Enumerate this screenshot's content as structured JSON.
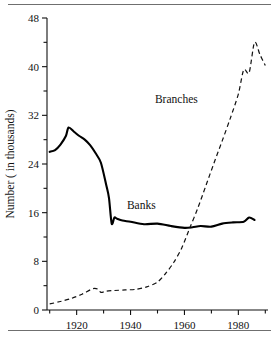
{
  "chart_data": {
    "type": "line",
    "title": "",
    "xlabel": "",
    "ylabel": "Number ( in thousands)",
    "xlim": [
      1909,
      1991
    ],
    "ylim": [
      0,
      48
    ],
    "grid": false,
    "legend_position": "inline-annotations",
    "y_ticks_major": [
      0,
      8,
      16,
      24,
      32,
      40,
      48
    ],
    "y_ticks_minor": [
      4,
      12,
      20,
      28,
      36,
      44
    ],
    "y_tick_labels": [
      "0",
      "8",
      "16",
      "24",
      "32",
      "40",
      "48"
    ],
    "x_ticks_major": [
      1920,
      1940,
      1960,
      1980
    ],
    "x_ticks_minor": [
      1910,
      1930,
      1950,
      1970,
      1990
    ],
    "x_tick_labels": [
      "1920",
      "1940",
      "1960",
      "1980"
    ],
    "series": [
      {
        "name": "Banks",
        "style": "solid",
        "label_x": 1944,
        "label_y": 16.6,
        "x": [
          1910,
          1912,
          1914,
          1916,
          1917,
          1919,
          1921,
          1923,
          1925,
          1927,
          1929,
          1931,
          1932,
          1933,
          1934,
          1935,
          1937,
          1940,
          1945,
          1950,
          1955,
          1960,
          1963,
          1966,
          1970,
          1974,
          1978,
          1982,
          1984,
          1986
        ],
        "y": [
          26.0,
          26.3,
          27.2,
          28.6,
          30.0,
          29.3,
          28.6,
          28.0,
          27.1,
          25.8,
          24.2,
          20.5,
          18.4,
          14.2,
          15.2,
          15.0,
          14.7,
          14.5,
          14.1,
          14.2,
          13.8,
          13.5,
          13.6,
          13.8,
          13.7,
          14.2,
          14.4,
          14.5,
          15.2,
          14.8
        ]
      },
      {
        "name": "Branches",
        "style": "dashed",
        "label_x": 1957,
        "label_y": 34.0,
        "x": [
          1910,
          1914,
          1918,
          1922,
          1926,
          1928,
          1929,
          1931,
          1934,
          1938,
          1942,
          1946,
          1950,
          1953,
          1956,
          1959,
          1962,
          1965,
          1968,
          1971,
          1974,
          1977,
          1980,
          1982,
          1984,
          1986,
          1988,
          1990
        ],
        "y": [
          1.0,
          1.4,
          1.9,
          2.6,
          3.5,
          3.4,
          2.9,
          3.1,
          3.2,
          3.3,
          3.4,
          3.8,
          4.6,
          6.0,
          7.8,
          10.2,
          13.5,
          16.8,
          20.5,
          24.2,
          27.8,
          31.5,
          35.5,
          39.5,
          39.0,
          44.0,
          42.0,
          40.2
        ]
      }
    ]
  },
  "labels": {
    "banks": "Banks",
    "branches": "Branches",
    "y_axis_title": "Number ( in thousands)"
  }
}
